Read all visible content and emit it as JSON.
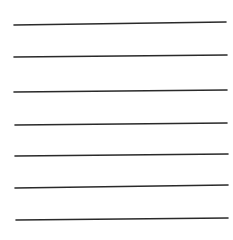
{
  "background": "#ffffff",
  "line_color": "#2a2a2a",
  "line_width": 1.6,
  "lines": [
    {
      "x1": 14,
      "y1": 25,
      "x2": 226,
      "y2": 22
    },
    {
      "x1": 14,
      "y1": 57,
      "x2": 227,
      "y2": 55
    },
    {
      "x1": 14,
      "y1": 92,
      "x2": 227,
      "y2": 90
    },
    {
      "x1": 15,
      "y1": 125,
      "x2": 227,
      "y2": 123
    },
    {
      "x1": 15,
      "y1": 156,
      "x2": 228,
      "y2": 154
    },
    {
      "x1": 15,
      "y1": 188,
      "x2": 228,
      "y2": 185
    },
    {
      "x1": 16,
      "y1": 220,
      "x2": 228,
      "y2": 218
    }
  ]
}
